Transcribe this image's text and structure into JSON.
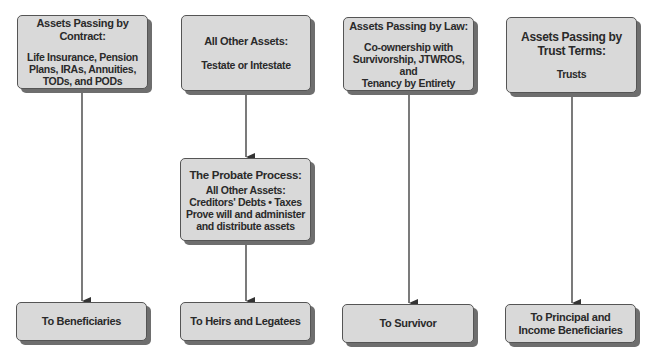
{
  "diagram": {
    "type": "flowchart",
    "top_row": [
      {
        "id": "contract",
        "title": "Assets Passing by Contract:",
        "body": [
          "Life Insurance, Pension",
          "Plans, IRAs, Annuities,",
          "TODs, and PODs"
        ]
      },
      {
        "id": "other",
        "title": "All Other Assets:",
        "body": [
          "Testate or Intestate"
        ]
      },
      {
        "id": "law",
        "title": "Assets Passing by Law:",
        "body": [
          "Co-ownership with",
          "Survivorship, JTWROS, and",
          "Tenancy by Entirety"
        ]
      },
      {
        "id": "trust",
        "title_lines": [
          "Assets Passing by",
          "Trust Terms:"
        ],
        "body": [
          "Trusts"
        ]
      }
    ],
    "middle": {
      "id": "probate",
      "title": "The Probate Process:",
      "body": [
        "All Other Assets:",
        "Creditors' Debts • Taxes",
        "Prove will and administer",
        "and distribute assets"
      ]
    },
    "bottom_row": [
      {
        "id": "beneficiaries",
        "lines": [
          "To Beneficiaries"
        ]
      },
      {
        "id": "heirs",
        "lines": [
          "To Heirs and Legatees"
        ]
      },
      {
        "id": "survivor",
        "lines": [
          "To Survivor"
        ]
      },
      {
        "id": "principal",
        "lines": [
          "To Principal and",
          "Income Beneficiaries"
        ]
      }
    ],
    "edges": [
      [
        "contract",
        "beneficiaries"
      ],
      [
        "other",
        "probate"
      ],
      [
        "probate",
        "heirs"
      ],
      [
        "law",
        "survivor"
      ],
      [
        "trust",
        "principal"
      ]
    ],
    "colors": {
      "box_fill": "#d9d9d9",
      "box_border": "#555555",
      "shadow": "#6e6e6e",
      "text": "#2a2a2a",
      "arrow": "#333333"
    }
  }
}
